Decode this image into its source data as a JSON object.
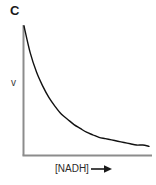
{
  "figure": {
    "panel_label": "C",
    "background_color": "#ffffff",
    "axis_color": "#8c8c8c",
    "curve_color": "#111111"
  },
  "chart_data": {
    "type": "line",
    "title": "C",
    "xlabel": "[NADH]",
    "xlabel_arrow": "right-arrow",
    "ylabel": "v",
    "grid": false,
    "legend": null,
    "axis_ticks": false,
    "axis_tick_labels": false,
    "xlim": [
      0,
      1
    ],
    "ylim": [
      0,
      1
    ],
    "series": [
      {
        "name": "v vs [NADH]",
        "x": [
          0.0,
          0.05,
          0.1,
          0.15,
          0.2,
          0.25,
          0.3,
          0.35,
          0.4,
          0.45,
          0.5,
          0.55,
          0.6,
          0.65,
          0.7,
          0.75,
          0.8,
          0.85,
          0.9,
          0.95,
          1.0
        ],
        "y": [
          1.0,
          0.79,
          0.64,
          0.53,
          0.44,
          0.37,
          0.31,
          0.27,
          0.23,
          0.2,
          0.17,
          0.15,
          0.13,
          0.12,
          0.11,
          0.1,
          0.09,
          0.08,
          0.07,
          0.07,
          0.06
        ]
      }
    ]
  }
}
